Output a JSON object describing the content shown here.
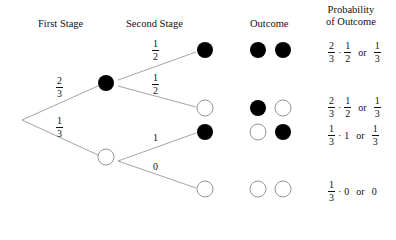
{
  "headers": {
    "first_stage": "First Stage",
    "second_stage": "Second Stage",
    "outcome": "Outcome",
    "probability_line1": "Probability",
    "probability_line2": "of Outcome"
  },
  "colors": {
    "line": "#9a9a9a",
    "filled": "#000000",
    "empty_stroke": "#8a8a8a"
  },
  "branches": {
    "stage1_top": {
      "num": "2",
      "den": "3"
    },
    "stage1_bottom": {
      "num": "1",
      "den": "3"
    },
    "stage2_a": {
      "num": "1",
      "den": "2"
    },
    "stage2_b": {
      "num": "1",
      "den": "2"
    },
    "stage2_c": "1",
    "stage2_d": "0"
  },
  "outcomes": [
    {
      "balls": [
        "black",
        "black"
      ],
      "f1": {
        "num": "2",
        "den": "3"
      },
      "op": "·",
      "f2": {
        "num": "1",
        "den": "2"
      },
      "or": "or",
      "result": {
        "num": "1",
        "den": "3"
      }
    },
    {
      "balls": [
        "black",
        "white"
      ],
      "f1": {
        "num": "2",
        "den": "3"
      },
      "op": "·",
      "f2": {
        "num": "1",
        "den": "2"
      },
      "or": "or",
      "result": {
        "num": "1",
        "den": "3"
      }
    },
    {
      "balls": [
        "white",
        "black"
      ],
      "f1": {
        "num": "1",
        "den": "3"
      },
      "op": "·",
      "f2_plain": "1",
      "or": "or",
      "result": {
        "num": "1",
        "den": "3"
      }
    },
    {
      "balls": [
        "white",
        "white"
      ],
      "f1": {
        "num": "1",
        "den": "3"
      },
      "op": "·",
      "f2_plain": "0",
      "or": "or",
      "result_plain": "0"
    }
  ]
}
